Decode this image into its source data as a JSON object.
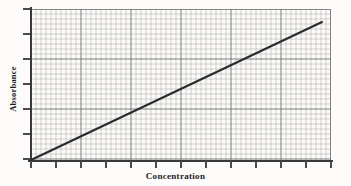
{
  "chart_data": {
    "type": "line",
    "title": "",
    "subtitle": "",
    "xlabel": "Concentration",
    "ylabel": "Absorbance",
    "x": [
      0,
      1,
      2,
      3,
      4,
      5,
      6
    ],
    "y": [
      0,
      0.155,
      0.31,
      0.465,
      0.62,
      0.775,
      0.9
    ],
    "series": [
      {
        "name": "Calibration curve",
        "x": [
          0,
          6
        ],
        "y": [
          0,
          0.9
        ],
        "color": "#2b2b2d",
        "linewidth": 2.0
      }
    ],
    "xlim": [
      0,
      6.2
    ],
    "ylim": [
      0,
      1.0
    ],
    "xticks": [
      0,
      0.5,
      1,
      1.5,
      2,
      2.5,
      3,
      3.5,
      4,
      4.5,
      5,
      5.5,
      6
    ],
    "yticks": [
      0,
      0.17,
      0.33,
      0.5,
      0.67,
      0.83,
      1.0
    ],
    "xticklabels": [],
    "yticklabels": [],
    "grid": true,
    "grid_minor": true,
    "grid_major_spacing_px": 50,
    "grid_minor_spacing_px": 5,
    "legend": false,
    "legend_position": "none",
    "annotations": []
  },
  "axes": {
    "x_label": "Concentration",
    "y_label": "Absorbance",
    "x_tick_positions_px": [
      31,
      56,
      81,
      106,
      131,
      156,
      181,
      206,
      231,
      256,
      281,
      306,
      331
    ],
    "y_tick_positions_px": [
      9,
      34,
      59,
      84,
      109,
      134,
      159
    ]
  },
  "style": {
    "line_color": "#2b2b2d",
    "axis_color": "#3a3a3c",
    "major_grid_color": "#606064",
    "minor_grid_color": "#8c8c92",
    "paper_color": "#fcfbf8",
    "label_color": "#1c1c1e"
  }
}
